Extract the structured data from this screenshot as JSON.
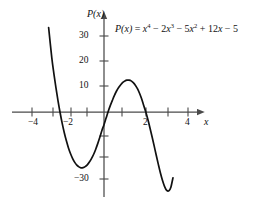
{
  "figure": {
    "background": "#ffffff",
    "axis_color": "#4a4a4a",
    "curve_color": "#111111",
    "label_color": "#111111"
  },
  "equation": {
    "lhs": "P(x)",
    "equals": "=",
    "t1_base": "x",
    "t1_exp": "4",
    "t2_sign": "−",
    "t2_coef": "2",
    "t2_base": "x",
    "t2_exp": "3",
    "t3_sign": "−",
    "t3_coef": "5",
    "t3_base": "x",
    "t3_exp": "2",
    "t4_sign": "+",
    "t4_coef": "12",
    "t4_base": "x",
    "t5_sign": "−",
    "t5_const": "5",
    "full": "P(x) = x^4 - 2x^3 - 5x^2 + 12x - 5"
  },
  "axes": {
    "y_axis_label": "P(x)",
    "x_axis_label": "x",
    "x_ticks": [
      {
        "value": -4,
        "label": "−4"
      },
      {
        "value": -3,
        "label": ""
      },
      {
        "value": -2,
        "label": "−2"
      },
      {
        "value": -1,
        "label": ""
      },
      {
        "value": 1,
        "label": ""
      },
      {
        "value": 2,
        "label": "2"
      },
      {
        "value": 3,
        "label": ""
      },
      {
        "value": 4,
        "label": "4"
      }
    ],
    "y_ticks": [
      {
        "value": 30,
        "label": "30"
      },
      {
        "value": 20,
        "label": "20"
      },
      {
        "value": 10,
        "label": "10"
      },
      {
        "value": -10,
        "label": ""
      },
      {
        "value": -20,
        "label": ""
      },
      {
        "value": -30,
        "label": "−30"
      }
    ],
    "xlim": [
      -4.9,
      4.9
    ],
    "ylim": [
      -36,
      34
    ],
    "grid": false
  },
  "chart_data": {
    "type": "line",
    "title": "",
    "xlabel": "x",
    "ylabel": "P(x)",
    "xlim": [
      -4.9,
      4.9
    ],
    "ylim": [
      -36,
      34
    ],
    "grid": false,
    "legend": "none",
    "annotations": [
      {
        "text": "P(x) = x^4 - 2x^3 - 5x^2 + 12x - 5",
        "x": 0.6,
        "y": 31
      }
    ],
    "series": [
      {
        "name": "P(x) = x^4 - 2x^3 - 5x^2 + 12x - 5",
        "color": "#111111",
        "x": [
          -2.65,
          -2.5,
          -2.4,
          -2.3,
          -2.2,
          -2.1,
          -2.0,
          -1.9,
          -1.8,
          -1.7,
          -1.6,
          -1.5,
          -1.4,
          -1.3,
          -1.2,
          -1.1,
          -1.0,
          -0.9,
          -0.8,
          -0.7,
          -0.6,
          -0.5,
          -0.4,
          -0.3,
          -0.2,
          -0.1,
          0.0,
          0.1,
          0.2,
          0.3,
          0.4,
          0.5,
          0.6,
          0.7,
          0.8,
          0.9,
          1.0,
          1.1,
          1.2,
          1.3,
          1.4,
          1.5,
          1.6,
          1.7,
          1.8,
          1.9,
          2.0,
          2.1,
          2.2,
          2.3,
          2.4,
          2.5,
          2.6,
          2.7,
          2.8,
          2.9,
          3.0,
          3.1,
          3.2,
          3.3
        ],
        "y": [
          33.4,
          21.6,
          15.3,
          9.6,
          4.4,
          -0.3,
          -4.5,
          -8.2,
          -11.4,
          -14.2,
          -16.5,
          -18.4,
          -19.9,
          -21.0,
          -21.7,
          -22.1,
          -22.0,
          -21.6,
          -20.9,
          -19.8,
          -18.4,
          -16.8,
          -14.8,
          -12.5,
          -10.0,
          -7.3,
          -5.0,
          -2.4,
          0.2,
          2.5,
          4.6,
          6.6,
          8.3,
          9.7,
          10.8,
          11.7,
          12.3,
          12.6,
          12.6,
          12.3,
          11.6,
          10.6,
          9.2,
          7.4,
          5.2,
          2.6,
          0.0,
          -3.0,
          -6.3,
          -9.8,
          -13.4,
          -17.1,
          -20.7,
          -24.1,
          -27.1,
          -29.5,
          -31.0,
          -31.2,
          -29.7,
          -26.0
        ],
        "note_shape": "quartic with deep left minimum near x=-1.1, local max near x=1.15, local min near x=2.05"
      }
    ]
  }
}
